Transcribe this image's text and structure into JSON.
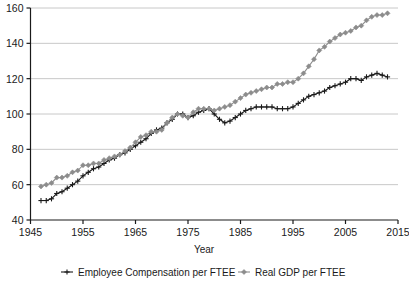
{
  "chart_data": {
    "type": "line",
    "title": "",
    "xlabel": "Year",
    "ylabel": "",
    "xlim": [
      1945,
      2015
    ],
    "ylim": [
      40,
      160
    ],
    "xticks": [
      1945,
      1955,
      1965,
      1975,
      1985,
      1995,
      2005,
      2015
    ],
    "yticks": [
      40,
      60,
      80,
      100,
      120,
      140,
      160
    ],
    "grid": "horizontal",
    "legend_position": "bottom",
    "x": [
      1947,
      1948,
      1949,
      1950,
      1951,
      1952,
      1953,
      1954,
      1955,
      1956,
      1957,
      1958,
      1959,
      1960,
      1961,
      1962,
      1963,
      1964,
      1965,
      1966,
      1967,
      1968,
      1969,
      1970,
      1971,
      1972,
      1973,
      1974,
      1975,
      1976,
      1977,
      1978,
      1979,
      1980,
      1981,
      1982,
      1983,
      1984,
      1985,
      1986,
      1987,
      1988,
      1989,
      1990,
      1991,
      1992,
      1993,
      1994,
      1995,
      1996,
      1997,
      1998,
      1999,
      2000,
      2001,
      2002,
      2003,
      2004,
      2005,
      2006,
      2007,
      2008,
      2009,
      2010,
      2011,
      2012,
      2013
    ],
    "series": [
      {
        "name": "Employee Compensation per FTEE",
        "color": "#1a1a1a",
        "marker": "plus",
        "values": [
          51,
          51,
          52,
          55,
          56,
          58,
          60,
          62,
          65,
          67,
          69,
          70,
          72,
          74,
          75,
          77,
          78,
          80,
          82,
          84,
          86,
          89,
          91,
          92,
          95,
          97,
          100,
          100,
          98,
          99,
          101,
          102,
          103,
          100,
          97,
          95,
          96,
          98,
          100,
          102,
          103,
          104,
          104,
          104,
          104,
          103,
          103,
          103,
          104,
          106,
          108,
          110,
          111,
          112,
          113,
          115,
          116,
          117,
          118,
          120,
          120,
          119,
          121,
          122,
          123,
          122,
          121
        ]
      },
      {
        "name": "Real GDP per FTEE",
        "color": "#8c8c8c",
        "marker": "diamond",
        "values": [
          59,
          60,
          61,
          64,
          64,
          65,
          67,
          68,
          71,
          71,
          72,
          72,
          74,
          75,
          76,
          77,
          79,
          81,
          84,
          87,
          88,
          90,
          90,
          91,
          95,
          98,
          100,
          99,
          98,
          101,
          103,
          103,
          103,
          102,
          103,
          104,
          105,
          107,
          109,
          111,
          112,
          113,
          114,
          115,
          115,
          117,
          117,
          118,
          118,
          120,
          123,
          127,
          131,
          136,
          138,
          141,
          143,
          145,
          146,
          147,
          149,
          150,
          153,
          155,
          156,
          156,
          157
        ]
      }
    ]
  },
  "legend": {
    "items": [
      {
        "label": "Employee Compensation per FTEE",
        "color": "#1a1a1a",
        "marker": "plus"
      },
      {
        "label": "Real GDP per FTEE",
        "color": "#8c8c8c",
        "marker": "diamond"
      }
    ]
  },
  "axes": {
    "x_axis_title": "Year",
    "x_tick_labels": [
      "1945",
      "1955",
      "1965",
      "1975",
      "1985",
      "1995",
      "2005",
      "2015"
    ],
    "y_tick_labels": [
      "40",
      "60",
      "80",
      "100",
      "120",
      "140",
      "160"
    ]
  },
  "colors": {
    "compensation_line": "#1a1a1a",
    "gdp_line": "#8c8c8c",
    "gridline": "#c8c8c8",
    "axis": "#1a1a1a",
    "background": "#ffffff"
  }
}
